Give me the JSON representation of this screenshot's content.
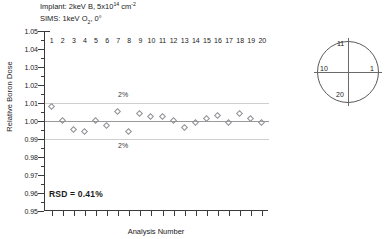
{
  "header": {
    "implant_prefix": "Implant: 2keV B, 5x10",
    "implant_exp": "14",
    "implant_unit": "cm",
    "implant_unit_exp": "-2",
    "sims_prefix": "SIMS: 1keV O",
    "sims_sub": "2",
    "sims_suffix": ", 0°"
  },
  "annotations": {
    "rsd": "RSD = 0.41%",
    "upper_band_label": "2%",
    "lower_band_label": "2%"
  },
  "wafer_map": {
    "name": "wafer-orientation-map",
    "top_label": "11",
    "right_label": "1",
    "bottom_label": "20",
    "left_label": "10"
  },
  "chart_data": {
    "type": "scatter",
    "xlabel": "Analysis Number",
    "ylabel": "Relative Boron Dose",
    "xlim": [
      0.4,
      20.6
    ],
    "ylim": [
      0.95,
      1.05
    ],
    "grid": false,
    "legend": null,
    "yticks": [
      "1.05",
      "1.04",
      "1.03",
      "1.02",
      "1.01",
      "1.00",
      "0.99",
      "0.98",
      "0.97",
      "0.96",
      "0.95"
    ],
    "ytick_values": [
      1.05,
      1.04,
      1.03,
      1.02,
      1.01,
      1.0,
      0.99,
      0.98,
      0.97,
      0.96,
      0.95
    ],
    "xticks": [
      "1",
      "2",
      "3",
      "4",
      "5",
      "6",
      "7",
      "8",
      "9",
      "10",
      "11",
      "12",
      "13",
      "14",
      "15",
      "16",
      "17",
      "18",
      "19",
      "20"
    ],
    "x": [
      1,
      2,
      3,
      4,
      5,
      6,
      7,
      8,
      9,
      10,
      11,
      12,
      13,
      14,
      15,
      16,
      17,
      18,
      19,
      20
    ],
    "values": [
      1.008,
      1.0,
      0.995,
      0.994,
      1.0,
      0.997,
      1.005,
      0.994,
      1.004,
      1.002,
      1.002,
      1.0,
      0.996,
      0.999,
      1.001,
      1.003,
      0.999,
      1.004,
      1.001,
      0.999
    ],
    "reference_lines": [
      {
        "y": 1.01,
        "label": "2%",
        "style": "light-gray"
      },
      {
        "y": 1.0,
        "label": "",
        "style": "gray-center"
      },
      {
        "y": 0.99,
        "label": "2%",
        "style": "light-gray"
      }
    ],
    "marker": "open-diamond",
    "rsd": "0.41%"
  }
}
